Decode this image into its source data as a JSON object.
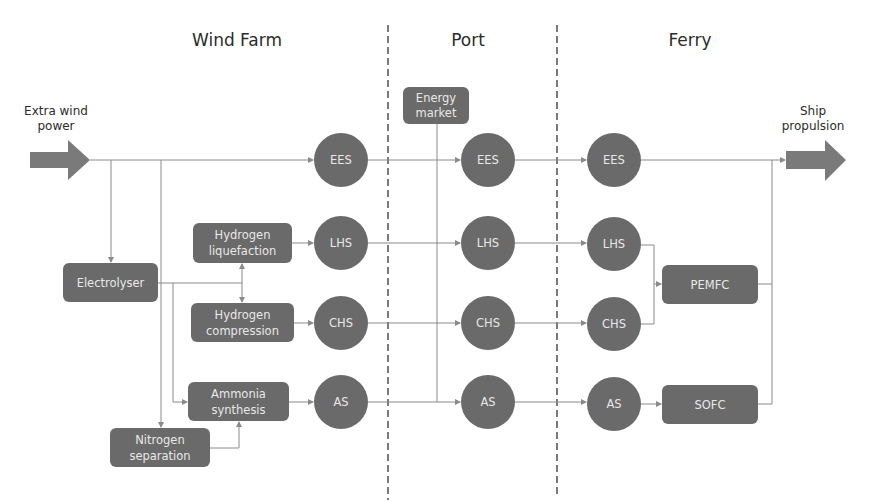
{
  "sections": [
    {
      "id": "wind-farm",
      "label": "Wind Farm"
    },
    {
      "id": "port",
      "label": "Port"
    },
    {
      "id": "ferry",
      "label": "Ferry"
    }
  ],
  "input": {
    "label_line1": "Extra wind",
    "label_line2": "power"
  },
  "output": {
    "label_line1": "Ship",
    "label_line2": "propulsion"
  },
  "processes": {
    "electrolyser": {
      "line1": "Electrolyser"
    },
    "hydrogen_liquefaction": {
      "line1": "Hydrogen",
      "line2": "liquefaction"
    },
    "hydrogen_compression": {
      "line1": "Hydrogen",
      "line2": "compression"
    },
    "ammonia_synthesis": {
      "line1": "Ammonia",
      "line2": "synthesis"
    },
    "nitrogen_separation": {
      "line1": "Nitrogen",
      "line2": "separation"
    },
    "energy_market": {
      "line1": "Energy",
      "line2": "market"
    },
    "pemfc": {
      "line1": "PEMFC"
    },
    "sofc": {
      "line1": "SOFC"
    }
  },
  "storage": {
    "wind_farm": [
      "EES",
      "LHS",
      "CHS",
      "AS"
    ],
    "port": [
      "EES",
      "LHS",
      "CHS",
      "AS"
    ],
    "ferry": [
      "EES",
      "LHS",
      "CHS",
      "AS"
    ]
  },
  "colors": {
    "node_fill": "#6a6a6a",
    "node_text": "#e8e8e8",
    "line": "#8a8a8a",
    "arrow_fill": "#7a7a7a",
    "divider": "#333333"
  }
}
